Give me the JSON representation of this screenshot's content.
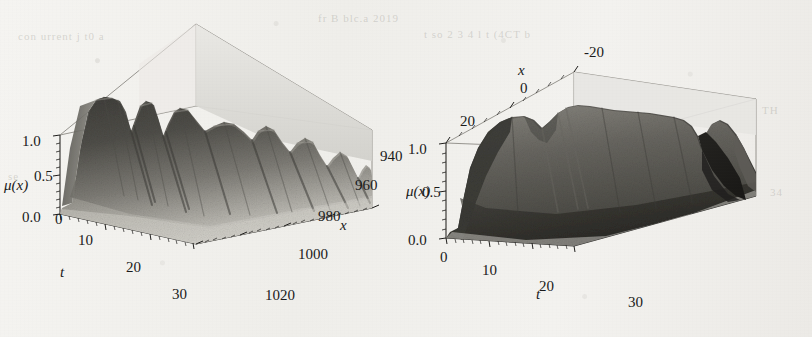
{
  "figure": {
    "kind": "scanned-figure",
    "background_hex": "#f2f1ee",
    "ink_hex": "#1a1a1a",
    "panel_count": 2
  },
  "ghost_text": [
    {
      "t": "fr B blc.a 2019",
      "x": 318,
      "y": 12
    },
    {
      "t": "con      urrent j t0   a",
      "x": 18,
      "y": 30
    },
    {
      "t": "t  so     2 3   4  l  t      (4CT   b",
      "x": 424,
      "y": 28
    },
    {
      "t": "se",
      "x": 8,
      "y": 170
    },
    {
      "t": "TH",
      "x": 762,
      "y": 104
    },
    {
      "t": "34",
      "x": 770,
      "y": 186
    }
  ],
  "chart_data": [
    {
      "id": "left",
      "type": "surface",
      "title": "",
      "xlabel": "t",
      "ylabel": "x",
      "zlabel": "μ(x)",
      "z_ticks": [
        "1.0",
        "0.5",
        "0.0"
      ],
      "z_values": [
        1.0,
        0.5,
        0.0
      ],
      "zlim": [
        0.0,
        1.0
      ],
      "t_ticks": [
        "0",
        "10",
        "20",
        "30"
      ],
      "t_values": [
        0,
        10,
        20,
        30
      ],
      "tlim": [
        0,
        35
      ],
      "x_ticks": [
        "940",
        "960",
        "980",
        "1000",
        "1020"
      ],
      "x_values": [
        940,
        960,
        980,
        1000,
        1020
      ],
      "xlim": [
        935,
        1025
      ],
      "grid": true,
      "legend": "none",
      "surface_description": "dark ridged membership surface with several deep vertical troughs, rising steeply from mu=0 near t=0 to a plateau near mu=1",
      "ridge_t_positions": [
        6,
        13,
        19,
        26,
        31
      ],
      "trough_t_positions": [
        10,
        16,
        23,
        29
      ],
      "series": [
        {
          "name": "ridge-crest-height",
          "values": [
            0.02,
            0.35,
            0.92,
            0.99,
            0.72,
            0.97,
            0.63,
            0.95,
            0.55,
            0.9,
            0.48
          ]
        },
        {
          "name": "front-edge-height",
          "values": [
            0.0,
            0.05,
            0.22,
            0.38,
            0.3,
            0.44,
            0.26,
            0.4,
            0.18,
            0.34,
            0.1
          ]
        }
      ]
    },
    {
      "id": "right",
      "type": "surface",
      "title": "",
      "xlabel": "t",
      "ylabel": "x",
      "zlabel": "μ(x)",
      "z_ticks": [
        "1.0",
        "0.5",
        "0.0"
      ],
      "z_values": [
        1.0,
        0.5,
        0.0
      ],
      "zlim": [
        0.0,
        1.0
      ],
      "t_ticks": [
        "0",
        "10",
        "20",
        "30"
      ],
      "t_values": [
        0,
        10,
        20,
        30
      ],
      "tlim": [
        0,
        35
      ],
      "x_ticks": [
        "-20",
        "0",
        "20"
      ],
      "x_values": [
        -20,
        0,
        20
      ],
      "xlim": [
        -26,
        26
      ],
      "grid": true,
      "legend": "none",
      "surface_description": "smooth broad membership plateau near mu=1 across most of t, with a shallow dip near t=10 and a deep dark notch cut into the far right edge near t=32",
      "plateau_height": 0.97,
      "dip_t_position": 11,
      "notch_t_position": 32,
      "series": [
        {
          "name": "ridge-crest-height",
          "values": [
            0.1,
            0.68,
            0.96,
            0.93,
            0.88,
            0.99,
            0.99,
            0.98,
            0.97,
            0.92,
            0.3
          ]
        },
        {
          "name": "front-edge-height",
          "values": [
            0.0,
            0.12,
            0.3,
            0.26,
            0.22,
            0.34,
            0.33,
            0.31,
            0.28,
            0.2,
            0.04
          ]
        }
      ]
    }
  ]
}
